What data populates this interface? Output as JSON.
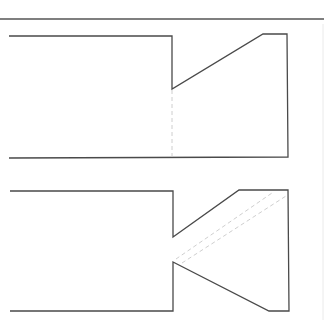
{
  "diagram": {
    "type": "technical-line-drawing",
    "colors": {
      "line": "#4a4a4a",
      "rule": "#555555",
      "hidden_line": "#c8c8c8",
      "background": "#ffffff"
    },
    "top_rule": {
      "x1": 0,
      "y1": 19,
      "x2": 324,
      "y2": 19
    },
    "figures": [
      {
        "name": "upper-profile",
        "description": "Rectangular body with single angled V-notch cut on upper right",
        "outline_points": "9,36 172,36 172,89 263,34 287,34 288,157 9,158",
        "hidden_lines": [
          {
            "x1": 172,
            "y1": 90,
            "x2": 172,
            "y2": 157
          }
        ]
      },
      {
        "name": "lower-profile",
        "description": "Rectangular body with double angled V-notch (nozzle shape) on right",
        "outline_points": "10,191 173,191 173,237 239,190 288,190 289,311 269,311 173,262 173,311 10,311",
        "hidden_lines": [
          {
            "x1": 176,
            "y1": 259,
            "x2": 272,
            "y2": 193
          },
          {
            "x1": 182,
            "y1": 263,
            "x2": 286,
            "y2": 196
          }
        ]
      }
    ],
    "right_edge": {
      "x1": 323,
      "y1": 24,
      "x2": 323,
      "y2": 320
    }
  }
}
